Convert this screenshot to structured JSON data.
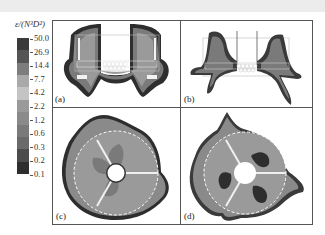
{
  "colorbar": {
    "title": "ε/(N³D²)",
    "labels": [
      "50.0",
      "26.9",
      "14.4",
      "7.7",
      "4.2",
      "2.2",
      "1.2",
      "0.6",
      "0.3",
      "0.2",
      "0.1"
    ],
    "colors": [
      "#3a3a3a",
      "#555555",
      "#7d7d7d",
      "#a9a9a9",
      "#c4c4c4",
      "#9a9a9a",
      "#8a8a8a",
      "#7a7a7a",
      "#6a6a6a",
      "#4c4c4c",
      "#2e2e2e"
    ]
  },
  "panels": [
    {
      "id": "a",
      "label": "(a)",
      "view": "side-axial",
      "impeller": "rushton-type"
    },
    {
      "id": "b",
      "label": "(b)",
      "view": "side-axial",
      "impeller": "curved-blade"
    },
    {
      "id": "c",
      "label": "(c)",
      "view": "top-radial",
      "impeller": "rushton-type"
    },
    {
      "id": "d",
      "label": "(d)",
      "view": "top-radial",
      "impeller": "curved-blade"
    }
  ]
}
